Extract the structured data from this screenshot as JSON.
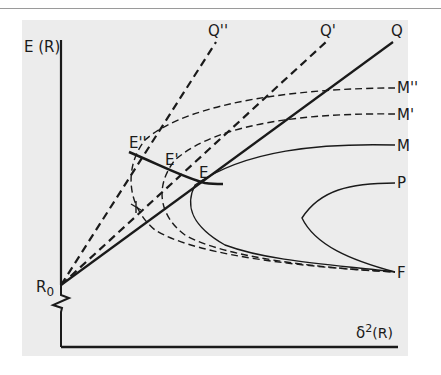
{
  "figure": {
    "axes": {
      "y_label": "E (R)",
      "x_label_base": "δ",
      "x_label_sup": "2",
      "x_label_tail": "(R)",
      "origin_label_base": "R",
      "origin_label_sub": "0"
    },
    "lines": [
      {
        "name": "Q",
        "label": "Q",
        "style": "solid"
      },
      {
        "name": "Q-prime",
        "label": "Q'",
        "style": "dashed"
      },
      {
        "name": "Q-double-prime",
        "label": "Q''",
        "style": "dashed"
      }
    ],
    "curves": [
      {
        "name": "M-double-prime",
        "label": "M''",
        "style": "dashed"
      },
      {
        "name": "M-prime",
        "label": "M'",
        "style": "dashed"
      },
      {
        "name": "M",
        "label": "M",
        "style": "solid"
      },
      {
        "name": "P",
        "label": "P",
        "style": "solid"
      },
      {
        "name": "F",
        "label": "F",
        "style": "solid"
      }
    ],
    "points": [
      {
        "name": "E",
        "label": "E"
      },
      {
        "name": "E-prime",
        "label": "E'"
      },
      {
        "name": "E-double-prime",
        "label": "E''"
      }
    ],
    "colors": {
      "ink": "#1a1a1a",
      "background": "#ececec"
    }
  }
}
